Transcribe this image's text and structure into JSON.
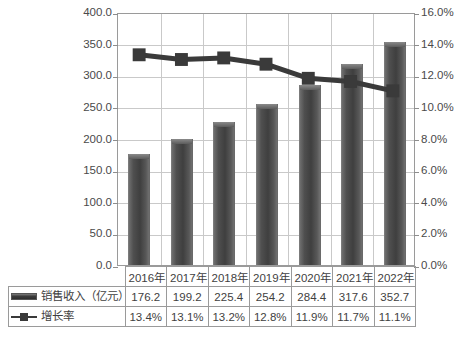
{
  "chart_data": {
    "type": "bar",
    "title": "",
    "subtitle": "",
    "xlabel": "",
    "ylabel": "",
    "categories": [
      "2016年",
      "2017年",
      "2018年",
      "2019年",
      "2020年",
      "2021年",
      "2022年"
    ],
    "series": [
      {
        "name": "销售收入（亿元）",
        "type": "bar",
        "axis": "left",
        "values": [
          176.2,
          199.2,
          225.4,
          254.2,
          284.4,
          317.6,
          352.7
        ],
        "labels": [
          "176.2",
          "199.2",
          "225.4",
          "254.2",
          "284.4",
          "317.6",
          "352.7"
        ],
        "color": "#4a4a4a",
        "marker": "bar-marker"
      },
      {
        "name": "增长率",
        "type": "line",
        "axis": "right",
        "values": [
          13.4,
          13.1,
          13.2,
          12.8,
          11.9,
          11.7,
          11.1
        ],
        "labels": [
          "13.4%",
          "13.1%",
          "13.2%",
          "12.8%",
          "11.9%",
          "11.7%",
          "11.1%"
        ],
        "color": "#3a3a3a",
        "marker": "square-marker"
      }
    ],
    "left_axis": {
      "min": 0,
      "max": 400,
      "step": 50,
      "ticks": [
        "0.0",
        "50.0",
        "100.0",
        "150.0",
        "200.0",
        "250.0",
        "300.0",
        "350.0",
        "400.0"
      ]
    },
    "right_axis": {
      "min": 0,
      "max": 16,
      "step": 2,
      "ticks": [
        "0.0%",
        "2.0%",
        "4.0%",
        "6.0%",
        "8.0%",
        "10.0%",
        "12.0%",
        "14.0%",
        "16.0%"
      ]
    },
    "grid": true,
    "legend_position": "data-table-below"
  },
  "data_table": {
    "corner_label": "",
    "column_headers": [
      "2016年",
      "2017年",
      "2018年",
      "2019年",
      "2020年",
      "2021年",
      "2022年"
    ],
    "rows": [
      {
        "marker": "bar-marker",
        "label": "销售收入（亿元）",
        "cells": [
          "176.2",
          "199.2",
          "225.4",
          "254.2",
          "284.4",
          "317.6",
          "352.7"
        ]
      },
      {
        "marker": "square-line-marker",
        "label": "增长率",
        "cells": [
          "13.4%",
          "13.1%",
          "13.2%",
          "12.8%",
          "11.9%",
          "11.7%",
          "11.1%"
        ]
      }
    ]
  },
  "caption": {
    "text": ""
  },
  "colors": {
    "bar": "#4a4a4a",
    "line": "#3a3a3a",
    "grid": "#c9c9c9",
    "frame": "#9a9a9a",
    "text": "#3f3f3f",
    "background": "#ffffff"
  }
}
